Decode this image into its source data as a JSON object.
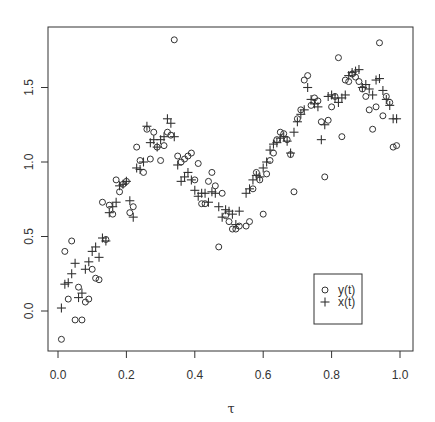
{
  "chart_data": {
    "type": "scatter",
    "title": "",
    "xlabel": "τ",
    "ylabel": "",
    "xlim": [
      -0.03,
      1.04
    ],
    "ylim": [
      -0.27,
      1.91
    ],
    "grid": false,
    "legend_position": "inside bottom right",
    "x_ticks": [
      "0.0",
      "0.2",
      "0.4",
      "0.6",
      "0.8",
      "1.0"
    ],
    "y_ticks": [
      "0.0",
      "0.5",
      "1.0",
      "1.5"
    ],
    "legend": [
      {
        "label": "y(t)",
        "marker": "circle"
      },
      {
        "label": "x(t)",
        "marker": "plus"
      }
    ],
    "series": [
      {
        "name": "y(t)",
        "marker": "circle",
        "points": [
          [
            0.01,
            -0.19
          ],
          [
            0.02,
            0.4
          ],
          [
            0.03,
            0.08
          ],
          [
            0.04,
            0.47
          ],
          [
            0.05,
            -0.06
          ],
          [
            0.06,
            0.16
          ],
          [
            0.07,
            -0.06
          ],
          [
            0.08,
            0.06
          ],
          [
            0.09,
            0.08
          ],
          [
            0.1,
            0.28
          ],
          [
            0.11,
            0.22
          ],
          [
            0.12,
            0.21
          ],
          [
            0.13,
            0.73
          ],
          [
            0.14,
            0.48
          ],
          [
            0.15,
            0.71
          ],
          [
            0.16,
            0.65
          ],
          [
            0.17,
            0.88
          ],
          [
            0.18,
            0.8
          ],
          [
            0.19,
            0.85
          ],
          [
            0.2,
            0.87
          ],
          [
            0.21,
            0.66
          ],
          [
            0.22,
            0.7
          ],
          [
            0.23,
            1.1
          ],
          [
            0.24,
            1.01
          ],
          [
            0.25,
            0.93
          ],
          [
            0.26,
            1.22
          ],
          [
            0.27,
            1.02
          ],
          [
            0.28,
            1.2
          ],
          [
            0.29,
            1.1
          ],
          [
            0.3,
            1.01
          ],
          [
            0.31,
            1.11
          ],
          [
            0.32,
            1.2
          ],
          [
            0.33,
            1.18
          ],
          [
            0.34,
            1.82
          ],
          [
            0.35,
            1.04
          ],
          [
            0.36,
            1.0
          ],
          [
            0.37,
            1.02
          ],
          [
            0.38,
            1.04
          ],
          [
            0.39,
            1.06
          ],
          [
            0.4,
            0.88
          ],
          [
            0.41,
            0.99
          ],
          [
            0.42,
            0.72
          ],
          [
            0.43,
            0.72
          ],
          [
            0.44,
            0.87
          ],
          [
            0.45,
            0.93
          ],
          [
            0.46,
            0.84
          ],
          [
            0.47,
            0.43
          ],
          [
            0.48,
            0.79
          ],
          [
            0.49,
            0.64
          ],
          [
            0.5,
            0.6
          ],
          [
            0.51,
            0.55
          ],
          [
            0.52,
            0.55
          ],
          [
            0.53,
            0.57
          ],
          [
            0.55,
            0.57
          ],
          [
            0.56,
            0.6
          ],
          [
            0.57,
            0.82
          ],
          [
            0.58,
            0.93
          ],
          [
            0.59,
            0.88
          ],
          [
            0.6,
            0.65
          ],
          [
            0.61,
            0.92
          ],
          [
            0.62,
            1.01
          ],
          [
            0.63,
            1.06
          ],
          [
            0.64,
            1.15
          ],
          [
            0.65,
            1.2
          ],
          [
            0.66,
            1.19
          ],
          [
            0.67,
            1.15
          ],
          [
            0.68,
            1.05
          ],
          [
            0.69,
            0.8
          ],
          [
            0.7,
            1.29
          ],
          [
            0.71,
            1.35
          ],
          [
            0.72,
            1.55
          ],
          [
            0.73,
            1.58
          ],
          [
            0.74,
            1.38
          ],
          [
            0.75,
            1.43
          ],
          [
            0.76,
            1.41
          ],
          [
            0.77,
            1.27
          ],
          [
            0.78,
            0.9
          ],
          [
            0.79,
            1.28
          ],
          [
            0.8,
            1.37
          ],
          [
            0.81,
            1.44
          ],
          [
            0.82,
            1.7
          ],
          [
            0.83,
            1.17
          ],
          [
            0.84,
            1.55
          ],
          [
            0.85,
            1.54
          ],
          [
            0.86,
            1.59
          ],
          [
            0.87,
            1.57
          ],
          [
            0.88,
            1.54
          ],
          [
            0.89,
            1.49
          ],
          [
            0.9,
            1.44
          ],
          [
            0.91,
            1.35
          ],
          [
            0.92,
            1.22
          ],
          [
            0.93,
            1.37
          ],
          [
            0.94,
            1.8
          ],
          [
            0.95,
            1.31
          ],
          [
            0.96,
            1.44
          ],
          [
            0.97,
            1.4
          ],
          [
            0.98,
            1.1
          ],
          [
            0.99,
            1.11
          ]
        ]
      },
      {
        "name": "x(t)",
        "marker": "plus",
        "points": [
          [
            0.01,
            0.02
          ],
          [
            0.02,
            0.18
          ],
          [
            0.03,
            0.19
          ],
          [
            0.04,
            0.25
          ],
          [
            0.05,
            0.32
          ],
          [
            0.06,
            0.09
          ],
          [
            0.07,
            0.12
          ],
          [
            0.08,
            0.28
          ],
          [
            0.09,
            0.33
          ],
          [
            0.1,
            0.4
          ],
          [
            0.11,
            0.43
          ],
          [
            0.12,
            0.36
          ],
          [
            0.13,
            0.49
          ],
          [
            0.14,
            0.47
          ],
          [
            0.15,
            0.66
          ],
          [
            0.16,
            0.7
          ],
          [
            0.17,
            0.73
          ],
          [
            0.18,
            0.84
          ],
          [
            0.19,
            0.85
          ],
          [
            0.2,
            0.87
          ],
          [
            0.21,
            0.74
          ],
          [
            0.22,
            0.63
          ],
          [
            0.23,
            0.96
          ],
          [
            0.24,
            0.95
          ],
          [
            0.25,
            1.0
          ],
          [
            0.26,
            1.24
          ],
          [
            0.27,
            1.13
          ],
          [
            0.28,
            1.15
          ],
          [
            0.29,
            1.1
          ],
          [
            0.3,
            1.15
          ],
          [
            0.31,
            1.17
          ],
          [
            0.32,
            1.29
          ],
          [
            0.33,
            1.26
          ],
          [
            0.34,
            1.17
          ],
          [
            0.35,
            0.98
          ],
          [
            0.36,
            0.87
          ],
          [
            0.37,
            0.9
          ],
          [
            0.38,
            0.93
          ],
          [
            0.39,
            0.88
          ],
          [
            0.4,
            0.81
          ],
          [
            0.41,
            0.77
          ],
          [
            0.42,
            0.79
          ],
          [
            0.43,
            0.79
          ],
          [
            0.44,
            0.73
          ],
          [
            0.45,
            0.8
          ],
          [
            0.46,
            0.79
          ],
          [
            0.47,
            0.7
          ],
          [
            0.48,
            0.63
          ],
          [
            0.49,
            0.68
          ],
          [
            0.5,
            0.67
          ],
          [
            0.51,
            0.65
          ],
          [
            0.52,
            0.58
          ],
          [
            0.53,
            0.67
          ],
          [
            0.55,
            0.79
          ],
          [
            0.56,
            0.82
          ],
          [
            0.57,
            0.88
          ],
          [
            0.58,
            0.91
          ],
          [
            0.59,
            0.9
          ],
          [
            0.6,
            0.96
          ],
          [
            0.61,
            1.0
          ],
          [
            0.62,
            1.08
          ],
          [
            0.63,
            1.12
          ],
          [
            0.64,
            1.13
          ],
          [
            0.65,
            1.16
          ],
          [
            0.66,
            1.17
          ],
          [
            0.67,
            1.14
          ],
          [
            0.68,
            1.06
          ],
          [
            0.69,
            1.2
          ],
          [
            0.7,
            1.27
          ],
          [
            0.71,
            1.32
          ],
          [
            0.72,
            1.35
          ],
          [
            0.73,
            1.5
          ],
          [
            0.74,
            1.42
          ],
          [
            0.75,
            1.39
          ],
          [
            0.76,
            1.37
          ],
          [
            0.77,
            1.15
          ],
          [
            0.78,
            1.25
          ],
          [
            0.79,
            1.44
          ],
          [
            0.8,
            1.45
          ],
          [
            0.81,
            1.43
          ],
          [
            0.82,
            1.4
          ],
          [
            0.83,
            1.43
          ],
          [
            0.84,
            1.45
          ],
          [
            0.85,
            1.58
          ],
          [
            0.86,
            1.6
          ],
          [
            0.87,
            1.61
          ],
          [
            0.88,
            1.62
          ],
          [
            0.89,
            1.5
          ],
          [
            0.9,
            1.52
          ],
          [
            0.91,
            1.49
          ],
          [
            0.92,
            1.45
          ],
          [
            0.93,
            1.55
          ],
          [
            0.94,
            1.56
          ],
          [
            0.95,
            1.48
          ],
          [
            0.96,
            1.42
          ],
          [
            0.97,
            1.38
          ],
          [
            0.98,
            1.29
          ],
          [
            0.99,
            1.29
          ]
        ]
      }
    ]
  }
}
